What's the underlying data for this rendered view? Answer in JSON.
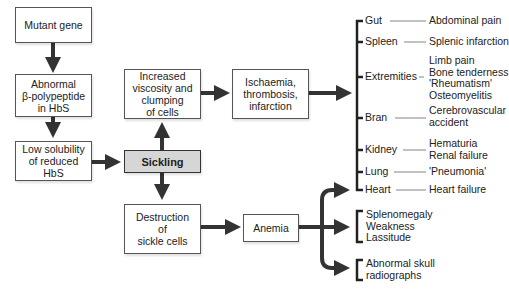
{
  "diagram": {
    "type": "flowchart",
    "nodes": {
      "mutant_gene": "Mutant gene",
      "abnormal_polypeptide": "Abnormal\nβ-polypeptide\nin HbS",
      "low_solubility": "Low solubility\nof reduced\nHbS",
      "sickling": "Sickling",
      "increased_viscosity": "Increased\nviscosity and\nclumping\nof cells",
      "ischaemia": "Ischaemia,\nthrombosis,\ninfarction",
      "destruction": "Destruction\nof\nsickle cells",
      "anemia": "Anemia"
    },
    "organs": [
      {
        "organ": "Gut",
        "effect": "Abdominal pain"
      },
      {
        "organ": "Spleen",
        "effect": "Splenic infarction"
      },
      {
        "organ": "Extremities",
        "effect": "Limb pain\nBone tenderness\n'Rheumatism'\nOsteomyelitis"
      },
      {
        "organ": "Bran",
        "effect": "Cerebrovascular\naccident"
      },
      {
        "organ": "Kidney",
        "effect": "Hematuria\nRenal failure"
      },
      {
        "organ": "Lung",
        "effect": "'Pneumonia'"
      },
      {
        "organ": "Heart",
        "effect": "Heart failure"
      }
    ],
    "anemia_effects": [
      "Splenomegaly\nWeakness\nLassitude",
      "Abnormal skull\nradiographs"
    ],
    "colors": {
      "arrow": "#333333",
      "sickling_fill": "#d6d6d6",
      "box_border": "#555555"
    }
  }
}
